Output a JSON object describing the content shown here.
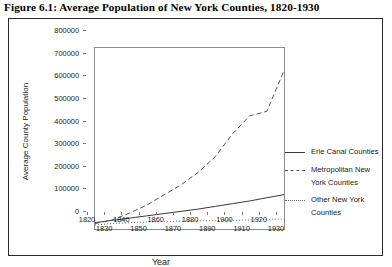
{
  "figure": {
    "title": "Figure 6.1: Average Population of New York Counties, 1820-1930"
  },
  "axes": {
    "xlabel": "Year",
    "ylabel": "Average County Population",
    "yticks": [
      "0",
      "100000",
      "200000",
      "300000",
      "400000",
      "500000",
      "600000",
      "700000",
      "800000"
    ],
    "xticks": [
      "1820",
      "1830",
      "1840",
      "1850",
      "1860",
      "1870",
      "1880",
      "1890",
      "1900",
      "1910",
      "1920",
      "1930"
    ]
  },
  "legend": {
    "entries": [
      {
        "label_line1": "Erie Canal Counties",
        "label_line2": "",
        "style": "solid"
      },
      {
        "label_line1": "Metropolitan New",
        "label_line2": "York Counties",
        "style": "dashed"
      },
      {
        "label_line1": "Other New York",
        "label_line2": "Counties",
        "style": "dotted"
      }
    ]
  },
  "chart_data": {
    "type": "line",
    "title": "Figure 6.1: Average Population of New York Counties, 1820-1930",
    "xlabel": "Year",
    "ylabel": "Average County Population",
    "xlim": [
      1820,
      1930
    ],
    "ylim": [
      0,
      800000
    ],
    "grid": false,
    "legend_position": "right",
    "x": [
      1820,
      1830,
      1840,
      1850,
      1860,
      1870,
      1880,
      1890,
      1900,
      1910,
      1920,
      1930
    ],
    "series": [
      {
        "name": "Erie Canal Counties",
        "style": "solid",
        "color": "#3a3a3a",
        "values": [
          28000,
          38000,
          48000,
          58000,
          68000,
          78000,
          88000,
          100000,
          112000,
          124000,
          138000,
          152000
        ]
      },
      {
        "name": "Metropolitan New York Counties",
        "style": "dashed",
        "color": "#555555",
        "values": [
          24000,
          40000,
          70000,
          105000,
          150000,
          195000,
          250000,
          320000,
          420000,
          500000,
          520000,
          700000
        ]
      },
      {
        "name": "Other New York Counties",
        "style": "dotted",
        "color": "#666666",
        "values": [
          18000,
          24000,
          28000,
          31000,
          33000,
          35000,
          36000,
          37000,
          38000,
          40000,
          42000,
          45000
        ]
      }
    ]
  }
}
